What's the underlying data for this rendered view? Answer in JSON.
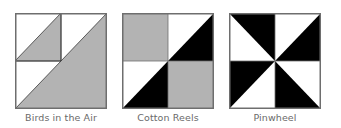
{
  "colors": {
    "gray": "#b3b3b3",
    "black": "#000000",
    "white": "#ffffff",
    "border": "#6e6e6e",
    "label": "#6a6a6a"
  },
  "blocks": [
    {
      "name": "Birds in the Air",
      "description": "Large half-square triangle (lower-right gray) with a small half-square triangle in the top-left quadrant (lower-right gray)"
    },
    {
      "name": "Cotton Reels",
      "description": "Four-patch: top-left gray square, top-right white/black half-square triangle, bottom-left white/black half-square triangle, bottom-right gray square"
    },
    {
      "name": "Pinwheel",
      "description": "Four half-square triangles in black and white rotating around the center"
    }
  ]
}
